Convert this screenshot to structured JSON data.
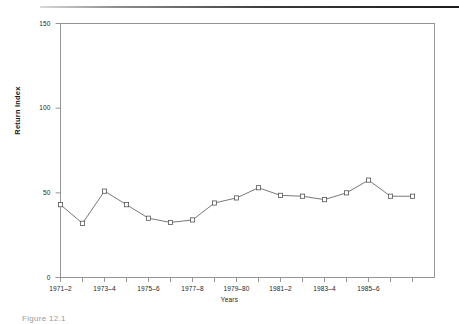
{
  "figure": {
    "caption": "Figure 12.1",
    "top_rule": "horizontal-rule"
  },
  "chart_data": {
    "type": "line",
    "title": "",
    "xlabel": "Years",
    "ylabel": "Return Index",
    "xlim": [
      0,
      17
    ],
    "ylim": [
      0,
      150
    ],
    "yticks": [
      0,
      50,
      100,
      150
    ],
    "ytick_labels": [
      "0",
      "50",
      "100",
      "150"
    ],
    "grid": false,
    "legend": false,
    "marker": "open-square",
    "line_color": "#555555",
    "marker_color": "#555555",
    "axis_color": "#8a8a8a",
    "categories": [
      "1971-2",
      "1972-3",
      "1973-4",
      "1974-5",
      "1975-6",
      "1976-7",
      "1977-8",
      "1978-9",
      "1979-80",
      "1980-1",
      "1981-2",
      "1982-3",
      "1983-4",
      "1984-5",
      "1985-6",
      "1986-7",
      "1987-8"
    ],
    "xtick_labels": [
      "1971–2",
      "1973–4",
      "1975–6",
      "1977–8",
      "1979–80",
      "1981–2",
      "1983–4",
      "1985–6"
    ],
    "xtick_label_indices": [
      0,
      2,
      4,
      6,
      8,
      10,
      12,
      14
    ],
    "values": [
      43,
      32,
      51,
      43,
      35,
      32.5,
      34,
      44,
      47,
      53,
      48.5,
      48,
      46,
      50,
      57.5,
      48,
      48
    ],
    "series": [
      {
        "name": "Return Index",
        "values": [
          43,
          32,
          51,
          43,
          35,
          32.5,
          34,
          44,
          47,
          53,
          48.5,
          48,
          46,
          50,
          57.5,
          48,
          48
        ]
      }
    ]
  }
}
